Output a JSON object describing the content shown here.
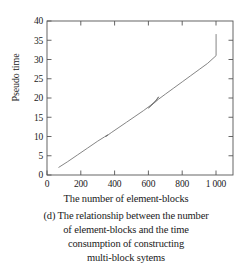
{
  "figure": {
    "label": "figure-d-pseudo-time-vs-element-blocks"
  },
  "axes": {
    "y_title": "Pseudo time",
    "x_title": "The number of element-blocks",
    "x_ticks": [
      "0",
      "200",
      "400",
      "600",
      "800",
      "1 000"
    ],
    "y_ticks": [
      "0",
      "5",
      "10",
      "15",
      "20",
      "25",
      "30",
      "35",
      "40"
    ]
  },
  "caption": {
    "line1": "(d) The relationship between the number",
    "line2": "of element-blocks and the time",
    "line3": "consumption of constructing",
    "line4": "multi-block sytems"
  },
  "colors": {
    "axis": "#4a4a4a",
    "line": "#6b6b6b",
    "text": "#1a1a1a",
    "background": "#ffffff"
  },
  "chart_data": {
    "type": "line",
    "title": "",
    "xlabel": "The number of element-blocks",
    "ylabel": "Pseudo time",
    "xlim": [
      0,
      1100
    ],
    "ylim": [
      0,
      40
    ],
    "xticks": [
      0,
      200,
      400,
      600,
      800,
      1000
    ],
    "yticks": [
      0,
      5,
      10,
      15,
      20,
      25,
      30,
      35,
      40
    ],
    "grid": false,
    "legend": null,
    "series": [
      {
        "name": "time consumption",
        "x": [
          70,
          120,
          180,
          240,
          300,
          340,
          360,
          345,
          355,
          380,
          420,
          470,
          520,
          570,
          610,
          650,
          660,
          630,
          600,
          620,
          660,
          700,
          750,
          800,
          850,
          900,
          950,
          1000,
          1000
        ],
        "y": [
          2.0,
          3.4,
          5.2,
          7.0,
          8.8,
          9.9,
          10.4,
          10.0,
          10.2,
          11.0,
          12.2,
          13.7,
          15.2,
          16.7,
          18.0,
          19.5,
          20.3,
          18.6,
          17.4,
          18.2,
          19.7,
          21.0,
          22.6,
          24.2,
          25.8,
          27.4,
          29.0,
          31.0,
          36.5
        ]
      }
    ],
    "annotations": [
      {
        "text": "vertical jump at x=1000 from y=31.0 to y=36.5"
      },
      {
        "text": "small self-crossing loop artifacts near x=350 and x=600-660"
      }
    ]
  }
}
